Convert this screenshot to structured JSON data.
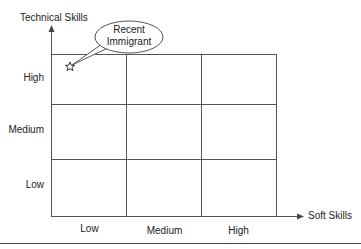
{
  "diagram": {
    "y_axis": {
      "title": "Technical Skills",
      "levels": [
        "High",
        "Medium",
        "Low"
      ]
    },
    "x_axis": {
      "title": "Soft Skills",
      "levels": [
        "Low",
        "Medium",
        "High"
      ]
    },
    "grid": {
      "rows": 3,
      "cols": 3
    },
    "marker": {
      "shape": "star",
      "position": {
        "technical": "High",
        "soft": "Low"
      },
      "callout_line1": "Recent",
      "callout_line2": "Immigrant"
    },
    "colors": {
      "line": "#555555",
      "text": "#222222",
      "background": "#ffffff"
    }
  }
}
